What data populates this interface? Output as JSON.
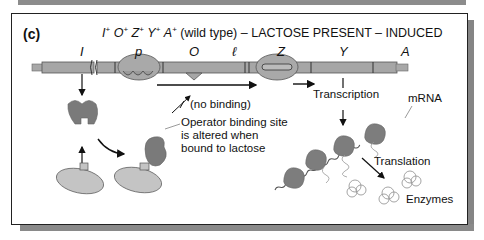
{
  "figure": {
    "panel_label": "(c)",
    "title": {
      "genotype": [
        {
          "gene": "I",
          "sup": "+"
        },
        {
          "gene": "O",
          "sup": "+"
        },
        {
          "gene": "Z",
          "sup": "+"
        },
        {
          "gene": "Y",
          "sup": "+"
        },
        {
          "gene": "A",
          "sup": "+"
        }
      ],
      "suffix": "(wild type) – LACTOSE PRESENT – INDUCED"
    },
    "genes": {
      "I": "I",
      "p": "p",
      "O": "O",
      "l": "ℓ",
      "Z": "Z",
      "Y": "Y",
      "A": "A"
    },
    "annotations": {
      "no_binding": "(no binding)",
      "operator_site_line1": "Operator binding site",
      "operator_site_line2": "is altered when",
      "operator_site_line3": "bound to lactose",
      "transcription": "Transcription",
      "mrna": "mRNA",
      "translation": "Translation",
      "enzymes": "Enzymes"
    },
    "colors": {
      "dna_bar": "#a6a6a6",
      "dna_outline": "#555555",
      "repressor_dark": "#7a7a7a",
      "lactose_light": "#c4c4c4",
      "ribosome": "#7d7d7d",
      "enzyme_outline": "#9a9a9a",
      "shadow": "#8a8a8a"
    }
  }
}
